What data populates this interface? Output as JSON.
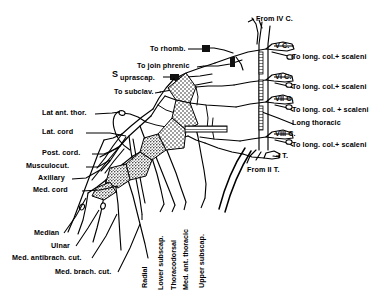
{
  "diagram": {
    "type": "anatomical-line-diagram",
    "ink_color": "#000000",
    "background_color": "#ffffff",
    "texture": "stippled-shading-on-trunks-and-cords"
  },
  "labels_left": [
    {
      "id": "to-rhomb",
      "text": "To rhomb.",
      "x": 150,
      "y": 49
    },
    {
      "id": "to-join-phrenic",
      "text": "To join phrenic",
      "x": 137,
      "y": 67
    },
    {
      "id": "suprascap-s",
      "text": "S",
      "x": 112,
      "y": 76
    },
    {
      "id": "suprascap-rest",
      "text": "uprascap.",
      "x": 119,
      "y": 80
    },
    {
      "id": "to-subclav",
      "text": "To subclav.",
      "x": 114,
      "y": 93
    },
    {
      "id": "lat-ant-thor",
      "text": "Lat ant. thor.",
      "x": 44,
      "y": 114
    },
    {
      "id": "lat-cord",
      "text": "Lat. cord",
      "x": 44,
      "y": 134
    },
    {
      "id": "post-cord",
      "text": "Post. cord.",
      "x": 44,
      "y": 155
    },
    {
      "id": "musculocut",
      "text": "Musculocut.",
      "x": 29,
      "y": 168
    },
    {
      "id": "axillary",
      "text": "Axillary",
      "x": 40,
      "y": 180
    },
    {
      "id": "med-cord",
      "text": "Med. cord",
      "x": 35,
      "y": 192
    },
    {
      "id": "median",
      "text": "Median",
      "x": 36,
      "y": 237
    },
    {
      "id": "ulnar",
      "text": "Ulnar",
      "x": 53,
      "y": 249
    },
    {
      "id": "med-antibrach",
      "text": "Med. antibrach. cut.",
      "x": 14,
      "y": 262
    },
    {
      "id": "med-brach",
      "text": "Med. brach. cut.",
      "x": 56,
      "y": 276
    }
  ],
  "labels_right": [
    {
      "id": "from-iv-c",
      "text": "From IV C.",
      "x": 256,
      "y": 21
    },
    {
      "id": "v-c",
      "text": "V C.",
      "x": 276,
      "y": 47
    },
    {
      "id": "to-long-1",
      "text": "To long. col.+ scaleni",
      "x": 293,
      "y": 59
    },
    {
      "id": "vi-c",
      "text": "VI C.",
      "x": 276,
      "y": 78
    },
    {
      "id": "to-long-2",
      "text": "To long. col.+ scaleni",
      "x": 293,
      "y": 88
    },
    {
      "id": "vii-c",
      "text": "VII C.",
      "x": 276,
      "y": 100
    },
    {
      "id": "to-long-3",
      "text": "To long. col. + scaleni",
      "x": 293,
      "y": 111
    },
    {
      "id": "long-thoracic",
      "text": "Long thoracic",
      "x": 293,
      "y": 124
    },
    {
      "id": "viii-c",
      "text": "VIII C.",
      "x": 276,
      "y": 135
    },
    {
      "id": "to-long-4",
      "text": "To long. col.+ scaleni",
      "x": 293,
      "y": 146
    },
    {
      "id": "i-t",
      "text": "I T.",
      "x": 278,
      "y": 157
    },
    {
      "id": "from-ii-t",
      "text": "From II T.",
      "x": 248,
      "y": 172
    }
  ],
  "labels_vertical": [
    {
      "id": "radial",
      "text": "Radial",
      "x": 139,
      "y": 265
    },
    {
      "id": "lower-subscap",
      "text": "Lower subscap.",
      "x": 155,
      "y": 268
    },
    {
      "id": "thoracodorsal",
      "text": "Thoracodorsal",
      "x": 168,
      "y": 268
    },
    {
      "id": "med-ant-thoracic",
      "text": "Med. ant. thoracic",
      "x": 180,
      "y": 268
    },
    {
      "id": "upper-subscap",
      "text": "Upper subscap.",
      "x": 196,
      "y": 265
    }
  ],
  "nerve_roots": [
    "IV C.",
    "V C.",
    "VI C.",
    "VII C.",
    "VIII C.",
    "I T.",
    "II T."
  ],
  "cords": [
    "Lat. cord",
    "Post. cord.",
    "Med. cord"
  ],
  "terminal_branches": [
    "Musculocut.",
    "Axillary",
    "Median",
    "Ulnar",
    "Radial",
    "Med. antibrach. cut.",
    "Med. brach. cut."
  ]
}
